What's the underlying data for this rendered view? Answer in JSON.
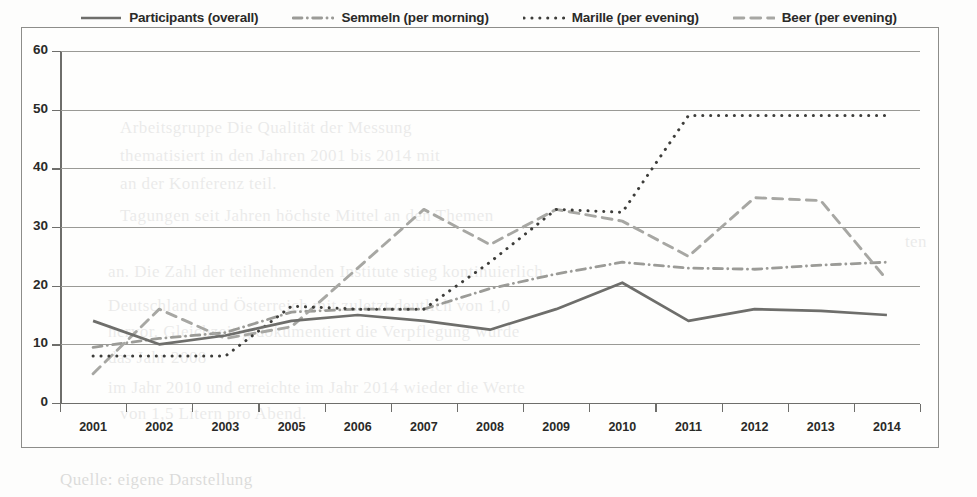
{
  "legend": {
    "items": [
      {
        "label": "Participants (overall)",
        "style": "solid",
        "color": "#6e6e6b",
        "name": "legend-participants"
      },
      {
        "label": "Semmeln (per morning)",
        "style": "dashdot",
        "color": "#9b9b97",
        "name": "legend-semmeln"
      },
      {
        "label": "Marille (per evening)",
        "style": "dotted",
        "color": "#3d3d3a",
        "name": "legend-marille"
      },
      {
        "label": "Beer (per evening)",
        "style": "dashed",
        "color": "#a7a7a3",
        "name": "legend-beer"
      }
    ]
  },
  "ghost_lines": [
    {
      "text": "Arbeitsgruppe  Die Qualität der Messung",
      "x": 120,
      "y": 118
    },
    {
      "text": "thematisiert  in den  Jahren  2001 bis 2014 mit",
      "x": 120,
      "y": 146
    },
    {
      "text": "an der Konferenz teil.",
      "x": 120,
      "y": 174
    },
    {
      "text": "Tagungen  seit  Jahren  höchste  Mittel  an  den  Themen",
      "x": 120,
      "y": 206
    },
    {
      "text": "ten",
      "x": 905,
      "y": 232
    },
    {
      "text": "an. Die  Zahl  der  teilnehmenden  Institute  stieg  kontinuierlich",
      "x": 108,
      "y": 262
    },
    {
      "text": "Deutschland  und  Österreich  mit  zuletzt  deutlich  von  1,0",
      "x": 108,
      "y": 296
    },
    {
      "text": "hervor. Gleichzeitig  dokumentiert  die  Verpflegung  wurde",
      "x": 108,
      "y": 322
    },
    {
      "text": "das  Jahr  2008",
      "x": 108,
      "y": 348
    },
    {
      "text": "im  Jahr  2010  und  erreichte  im  Jahr  2014  wieder  die  Werte",
      "x": 108,
      "y": 378
    },
    {
      "text": "von  1,5  Litern  pro  Abend.",
      "x": 120,
      "y": 404
    },
    {
      "text": "Quelle: eigene  Darstellung",
      "x": 60,
      "y": 470
    }
  ],
  "chart_data": {
    "type": "line",
    "title": "",
    "xlabel": "",
    "ylabel": "",
    "ylim": [
      0,
      60
    ],
    "ytick_step": 10,
    "yticks": [
      0,
      10,
      20,
      30,
      40,
      50,
      60
    ],
    "grid": true,
    "legend_position": "top-center",
    "categories": [
      "2001",
      "2002",
      "2003",
      "2005",
      "2006",
      "2007",
      "2008",
      "2009",
      "2010",
      "2011",
      "2012",
      "2013",
      "2014"
    ],
    "series": [
      {
        "name": "Participants (overall)",
        "style": "solid",
        "color": "#6e6e6b",
        "values": [
          14,
          10,
          11.5,
          14,
          15,
          14,
          12.5,
          16,
          20.5,
          14,
          16,
          15.7,
          15
        ]
      },
      {
        "name": "Semmeln (per morning)",
        "style": "dashdot",
        "color": "#9b9b97",
        "values": [
          9.5,
          11,
          12,
          15.5,
          16,
          16,
          19.5,
          22,
          24,
          23,
          22.8,
          23.5,
          24
        ]
      },
      {
        "name": "Marille (per evening)",
        "style": "dotted",
        "color": "#3d3d3a",
        "values": [
          8,
          8,
          8,
          16.5,
          16,
          16,
          24,
          33,
          32.5,
          49,
          49,
          49,
          49
        ]
      },
      {
        "name": "Beer (per evening)",
        "style": "dashed",
        "color": "#a7a7a3",
        "values": [
          5,
          16,
          11,
          13,
          23,
          33,
          27,
          33,
          31,
          25,
          35,
          34.5,
          21
        ]
      }
    ]
  }
}
